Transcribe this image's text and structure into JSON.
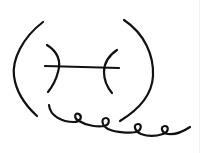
{
  "diagram": {
    "type": "line-sketch",
    "stroke_color": "#111111",
    "background": "#ffffff",
    "elements": [
      {
        "name": "left-outer-arc"
      },
      {
        "name": "right-outer-arc"
      },
      {
        "name": "left-inner-arc"
      },
      {
        "name": "right-inner-arc"
      },
      {
        "name": "horizontal-connector"
      },
      {
        "name": "coiled-tail"
      }
    ]
  }
}
